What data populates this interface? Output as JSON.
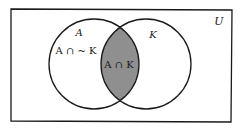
{
  "diagram": {
    "type": "venn",
    "universe": {
      "label": "U"
    },
    "sets": [
      {
        "id": "A",
        "label": "A"
      },
      {
        "id": "K",
        "label": "K"
      }
    ],
    "regions": [
      {
        "id": "a-not-k",
        "label": "A ∩ ~ K",
        "shaded": false
      },
      {
        "id": "a-and-k",
        "label": "A ∩ K",
        "shaded": true
      }
    ],
    "colors": {
      "stroke": "#1a1a1a",
      "shade": "#8f8f8f",
      "background": "#ffffff"
    }
  }
}
